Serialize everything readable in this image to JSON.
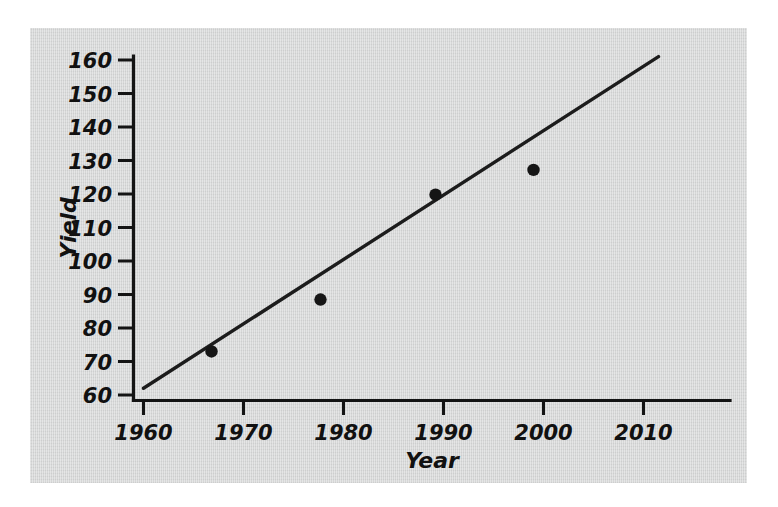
{
  "figure": {
    "background_color": "#ffffff",
    "panel_color": "#d5d6d6",
    "ink_color": "#141414"
  },
  "chart_data": {
    "type": "scatter",
    "title": "",
    "xlabel": "Year",
    "ylabel": "Yield",
    "xlim": [
      1958,
      2012
    ],
    "ylim": [
      58,
      164
    ],
    "xticks": [
      1960,
      1970,
      1980,
      1990,
      2000,
      2010
    ],
    "xtick_labels": [
      "1960",
      "1970",
      "1980",
      "1990",
      "2000",
      "2010"
    ],
    "yticks": [
      60,
      70,
      80,
      90,
      100,
      110,
      120,
      130,
      140,
      150,
      160
    ],
    "ytick_labels": [
      "60",
      "70",
      "80",
      "90",
      "100",
      "110",
      "120",
      "130",
      "140",
      "150",
      "160"
    ],
    "grid": false,
    "legend": null,
    "points": [
      {
        "x": 1966.8,
        "y": 73.0
      },
      {
        "x": 1977.7,
        "y": 88.5
      },
      {
        "x": 1989.2,
        "y": 119.8
      },
      {
        "x": 1999.0,
        "y": 127.2
      }
    ],
    "series": [
      {
        "name": "Yield observations",
        "type": "scatter",
        "marker": "filled-circle",
        "x": [
          1966.8,
          1977.7,
          1989.2,
          1999.0
        ],
        "values": [
          73.0,
          88.5,
          119.8,
          127.2
        ]
      },
      {
        "name": "Fitted trend line",
        "type": "line",
        "x": [
          1960.0,
          2011.5
        ],
        "values": [
          62.0,
          161.0
        ]
      }
    ],
    "trend_line": {
      "x_start": 1960.0,
      "y_start": 62.0,
      "x_end": 2011.5,
      "y_end": 161.0,
      "slope_per_year": 1.92
    },
    "annotations": []
  }
}
